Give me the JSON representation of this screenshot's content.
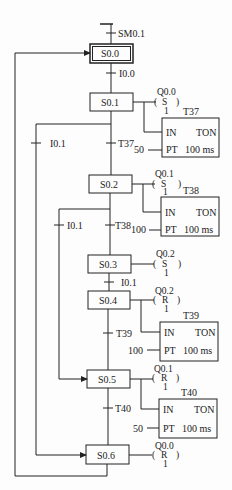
{
  "diagram": {
    "type": "sequential-function-chart",
    "initial_transition": "SM0.1",
    "steps": [
      {
        "id": "S0.0",
        "initial": true
      },
      {
        "id": "S0.1"
      },
      {
        "id": "S0.2"
      },
      {
        "id": "S0.3"
      },
      {
        "id": "S0.4"
      },
      {
        "id": "S0.5"
      },
      {
        "id": "S0.6"
      }
    ],
    "transitions": {
      "t0": "I0.0",
      "t1": "T37",
      "t1b": "I0.1",
      "t2": "T38",
      "t2b": "I0.1",
      "t3": "I0.1",
      "t4": "T39",
      "t5": "T40"
    },
    "coils": [
      {
        "addr": "Q0.0",
        "op": "S",
        "n": "1"
      },
      {
        "addr": "Q0.1",
        "op": "S",
        "n": "1"
      },
      {
        "addr": "Q0.2",
        "op": "S",
        "n": "1"
      },
      {
        "addr": "Q0.2",
        "op": "R",
        "n": "1"
      },
      {
        "addr": "Q0.1",
        "op": "R",
        "n": "1"
      },
      {
        "addr": "Q0.0",
        "op": "R",
        "n": "1"
      }
    ],
    "timers": [
      {
        "name": "T37",
        "in": "IN",
        "type": "TON",
        "pt_label": "PT",
        "pt": "50",
        "res": "100 ms"
      },
      {
        "name": "T38",
        "in": "IN",
        "type": "TON",
        "pt_label": "PT",
        "pt": "100",
        "res": "100 ms"
      },
      {
        "name": "T39",
        "in": "IN",
        "type": "TON",
        "pt_label": "PT",
        "pt": "100",
        "res": "100 ms"
      },
      {
        "name": "T40",
        "in": "IN",
        "type": "TON",
        "pt_label": "PT",
        "pt": "50",
        "res": "100 ms"
      }
    ]
  }
}
